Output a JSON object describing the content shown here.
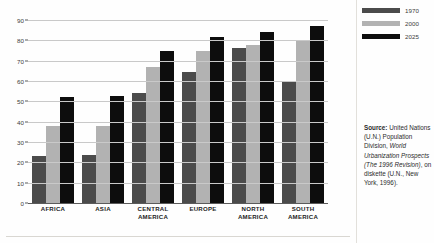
{
  "chart_data": {
    "type": "bar",
    "title": "",
    "subtitle": "",
    "xlabel": "",
    "ylabel": "",
    "ylim": [
      0,
      90
    ],
    "yticks": [
      0,
      10,
      20,
      30,
      40,
      50,
      60,
      70,
      80,
      90
    ],
    "grid": true,
    "legend_position": "top-right",
    "categories": [
      "AFRICA",
      "ASIA",
      "CENTRAL AMERICA",
      "EUROPE",
      "NORTH AMERICA",
      "SOUTH AMERICA"
    ],
    "series": [
      {
        "name": "1970",
        "color": "#4b4b4b",
        "values": [
          23,
          23.5,
          54,
          64.5,
          76,
          60
        ]
      },
      {
        "name": "2000",
        "color": "#b2b2b2",
        "values": [
          38,
          38,
          67,
          75,
          77.5,
          80
        ]
      },
      {
        "name": "2025",
        "color": "#0d0d0d",
        "values": [
          52,
          52.5,
          75,
          81.5,
          84,
          87
        ]
      }
    ]
  },
  "legend": {
    "items": [
      {
        "label": "1970"
      },
      {
        "label": "2000"
      },
      {
        "label": "2025"
      }
    ]
  },
  "yaxis": {
    "ticks": [
      "90",
      "80",
      "70",
      "60",
      "50",
      "40",
      "30",
      "20",
      "10",
      "0"
    ]
  },
  "xaxis": {
    "labels": [
      {
        "line1": "AFRICA",
        "line2": ""
      },
      {
        "line1": "ASIA",
        "line2": ""
      },
      {
        "line1": "CENTRAL",
        "line2": "AMERICA"
      },
      {
        "line1": "EUROPE",
        "line2": ""
      },
      {
        "line1": "NORTH",
        "line2": "AMERICA"
      },
      {
        "line1": "SOUTH",
        "line2": "AMERICA"
      }
    ]
  },
  "source": {
    "label": "Source:",
    "text_part1": " United Nations (U.N.) Population Division, ",
    "text_italic": "World Urbanization Prospects (The 1996 Revision)",
    "text_part2": ", on diskette (U.N., New York, 1996)."
  }
}
